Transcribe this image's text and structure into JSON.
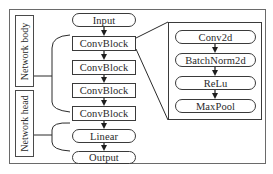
{
  "diagram": {
    "side_labels": {
      "body": "Network body",
      "head": "Network head"
    },
    "main_flow": [
      {
        "id": "input",
        "label": "Input",
        "shape": "pill"
      },
      {
        "id": "convblock1",
        "label": "ConvBlock",
        "shape": "rect"
      },
      {
        "id": "convblock2",
        "label": "ConvBlock",
        "shape": "rect"
      },
      {
        "id": "convblock3",
        "label": "ConvBlock",
        "shape": "rect"
      },
      {
        "id": "convblock4",
        "label": "ConvBlock",
        "shape": "rect"
      },
      {
        "id": "linear",
        "label": "Linear",
        "shape": "pill"
      },
      {
        "id": "output",
        "label": "Output",
        "shape": "pill"
      }
    ],
    "convblock_detail": [
      {
        "id": "conv2d",
        "label": "Conv2d",
        "shape": "pill"
      },
      {
        "id": "batchnorm2d",
        "label": "BatchNorm2d",
        "shape": "pill"
      },
      {
        "id": "relu",
        "label": "ReLu",
        "shape": "pill"
      },
      {
        "id": "maxpool",
        "label": "MaxPool",
        "shape": "pill"
      }
    ],
    "colors": {
      "line": "#3a3a3a",
      "frame": "#6a6a6a",
      "background": "#ffffff"
    }
  }
}
